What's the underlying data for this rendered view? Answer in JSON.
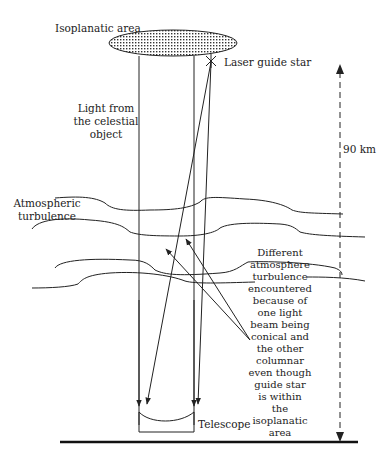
{
  "diagram": {
    "labels": {
      "isoplanatic_area": "Isoplanatic area",
      "laser_guide_star": "Laser guide star",
      "light_from": [
        "Light from",
        "the celestial",
        "object"
      ],
      "atmospheric": [
        "Atmospheric",
        "turbulence"
      ],
      "distance": "90 km",
      "telescope": "Telescope",
      "note": [
        "Different",
        "atmosphere",
        "turbulence",
        "encountered",
        "because of",
        "one light",
        "beam being",
        "conical and",
        "the other",
        "columnar",
        "even though",
        "guide star",
        "is within",
        "the",
        "isoplanatic",
        "area"
      ]
    },
    "colors": {
      "line": "#222222",
      "background": "#ffffff"
    }
  }
}
